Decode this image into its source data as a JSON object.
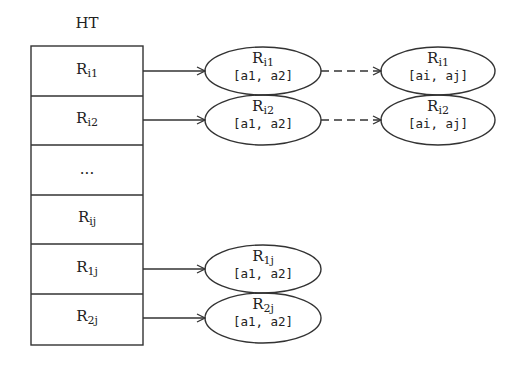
{
  "diagram": {
    "title": "HT",
    "table_rows": [
      {
        "base": "R",
        "sub": "i1"
      },
      {
        "base": "R",
        "sub": "i2"
      },
      {
        "base": "...",
        "sub": ""
      },
      {
        "base": "R",
        "sub": "ij"
      },
      {
        "base": "R",
        "sub": "1j"
      },
      {
        "base": "R",
        "sub": "2j"
      }
    ],
    "nodes": {
      "mid_i1": {
        "base": "R",
        "sub": "i1",
        "range": "[a1, a2]"
      },
      "mid_i2": {
        "base": "R",
        "sub": "i2",
        "range": "[a1, a2]"
      },
      "right_i1": {
        "base": "R",
        "sub": "i1",
        "range": "[ai, aj]"
      },
      "right_i2": {
        "base": "R",
        "sub": "i2",
        "range": "[ai, aj]"
      },
      "mid_1j": {
        "base": "R",
        "sub": "1j",
        "range": "[a1, a2]"
      },
      "mid_2j": {
        "base": "R",
        "sub": "2j",
        "range": "[a1, a2]"
      }
    },
    "edges": [
      {
        "from": "table_row_0",
        "to": "mid_i1",
        "style": "solid"
      },
      {
        "from": "table_row_1",
        "to": "mid_i2",
        "style": "solid"
      },
      {
        "from": "mid_i1",
        "to": "right_i1",
        "style": "dashed"
      },
      {
        "from": "mid_i2",
        "to": "right_i2",
        "style": "dashed"
      },
      {
        "from": "table_row_4",
        "to": "mid_1j",
        "style": "solid"
      },
      {
        "from": "table_row_5",
        "to": "mid_2j",
        "style": "solid"
      }
    ],
    "colors": {
      "stroke": "#333333",
      "text": "#222222",
      "background": "#ffffff"
    }
  }
}
